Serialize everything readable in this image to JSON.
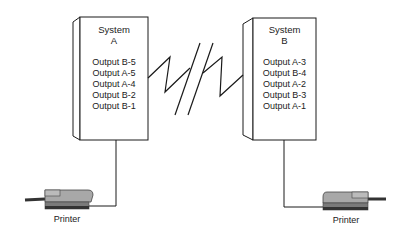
{
  "diagram": {
    "systems": [
      {
        "id": "A",
        "title_line1": "System",
        "title_line2": "A",
        "outputs": [
          "Output B-5",
          "Output A-5",
          "Output A-4",
          "Output B-2",
          "Output B-1"
        ]
      },
      {
        "id": "B",
        "title_line1": "System",
        "title_line2": "B",
        "outputs": [
          "Output A-3",
          "Output B-4",
          "Output A-2",
          "Output B-3",
          "Output A-1"
        ]
      }
    ],
    "printers": [
      {
        "label": "Printer",
        "attached_to": "A"
      },
      {
        "label": "Printer",
        "attached_to": "B"
      }
    ],
    "link": {
      "type": "communication-line",
      "icon": "lightning-zigzag-with-break"
    },
    "colors": {
      "line": "#1a1a1a",
      "printer_body": "#9a9a9a",
      "printer_dark": "#555555",
      "background": "#ffffff"
    }
  }
}
